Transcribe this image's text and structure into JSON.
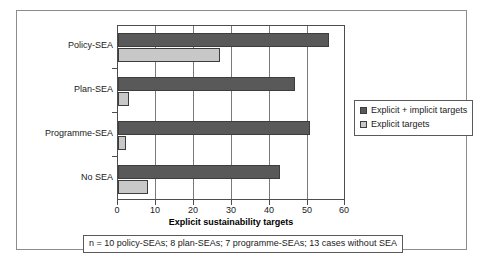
{
  "chart_data": {
    "type": "bar",
    "orientation": "horizontal",
    "title": "",
    "xlabel": "Explicit sustainability targets",
    "ylabel": "",
    "xlim": [
      0,
      60
    ],
    "xticks": [
      0,
      10,
      20,
      30,
      40,
      50,
      60
    ],
    "grid": true,
    "legend_position": "right",
    "categories": [
      "Policy-SEA",
      "Plan-SEA",
      "Programme-SEA",
      "No SEA"
    ],
    "series": [
      {
        "name": "Explicit + implicit targets",
        "color": "#595959",
        "values": [
          56,
          47,
          51,
          43
        ]
      },
      {
        "name": "Explicit targets",
        "color": "#c8c8c8",
        "values": [
          27,
          3,
          2,
          8
        ]
      }
    ],
    "annotations": [
      "n = 10 policy-SEAs; 8 plan-SEAs; 7 programme-SEAs; 13 cases without SEA"
    ]
  },
  "axis": {
    "x_title": "Explicit sustainability targets",
    "x_tick_labels": [
      "0",
      "10",
      "20",
      "30",
      "40",
      "50",
      "60"
    ],
    "y_tick_labels": [
      "Policy-SEA",
      "Plan-SEA",
      "Programme-SEA",
      "No SEA"
    ]
  },
  "legend": {
    "items": [
      {
        "label": "Explicit + implicit targets",
        "swatch": "dark-gray-swatch"
      },
      {
        "label": "Explicit targets",
        "swatch": "light-gray-swatch"
      }
    ]
  },
  "footnote": {
    "text": "n = 10 policy-SEAs; 8 plan-SEAs; 7 programme-SEAs; 13 cases without SEA"
  },
  "colors": {
    "series_total": "#595959",
    "series_explicit": "#c8c8c8",
    "frame": "#8c8c8c",
    "axis": "#4d4d4d"
  }
}
